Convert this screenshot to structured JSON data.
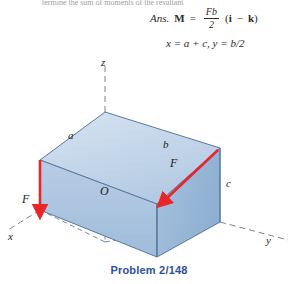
{
  "page": {
    "cropped_top_line": "termine the sum of moments of the resultant ",
    "caption": "Problem 2/148",
    "caption_color": "#2d4fa2"
  },
  "answer": {
    "label": "Ans.",
    "moment_symbol": "M",
    "equals": "=",
    "fraction_numerator": "Fb",
    "fraction_denominator": "2",
    "vector_open": "(",
    "vector_i": "i",
    "vector_minus": "−",
    "vector_k": "k",
    "vector_close": ")",
    "second_line": "x = a + c, y = b/2"
  },
  "diagram": {
    "type": "3d-box-force-diagram",
    "axes": [
      {
        "name": "z",
        "label": "z",
        "direction": "up",
        "style": "dashed"
      },
      {
        "name": "x",
        "label": "x",
        "direction": "down-left",
        "style": "dashed"
      },
      {
        "name": "y",
        "label": "y",
        "direction": "down-right",
        "style": "dashed"
      }
    ],
    "origin_label": "O",
    "edge_labels": [
      {
        "name": "a",
        "label": "a"
      },
      {
        "name": "b",
        "label": "b"
      },
      {
        "name": "c",
        "label": "c"
      }
    ],
    "forces": [
      {
        "name": "force-left",
        "label": "F",
        "direction": "downward-vertical",
        "color": "#e8262a"
      },
      {
        "name": "force-right",
        "label": "F",
        "direction": "along-top-rear-edge",
        "color": "#e8262a"
      }
    ],
    "colors": {
      "face_top": "#c2d5ea",
      "face_front_left": "#a8c2de",
      "face_front_right": "#9ab9d9",
      "edge": "#5878a0",
      "dashed": "#707070",
      "arrow": "#e8262a"
    }
  }
}
